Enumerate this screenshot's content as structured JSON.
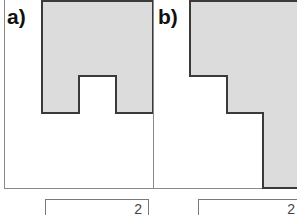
{
  "exercise": {
    "panels": [
      {
        "label": "a)",
        "grid": {
          "cols": 4,
          "rows": 5,
          "origin_x": 4,
          "cell_w": 37.25,
          "cell_h": 37.6
        },
        "shaded_cells": [
          [
            0,
            1
          ],
          [
            0,
            2
          ],
          [
            0,
            3
          ],
          [
            1,
            1
          ],
          [
            1,
            2
          ],
          [
            1,
            3
          ],
          [
            2,
            1
          ],
          [
            2,
            3
          ]
        ],
        "answer_unit": "2"
      },
      {
        "label": "b)",
        "grid": {
          "cols": 4,
          "rows": 5,
          "origin_x": 153,
          "cell_w": 36.7,
          "cell_h": 37.6
        },
        "shaded_cells": [
          [
            0,
            1
          ],
          [
            0,
            2
          ],
          [
            0,
            3
          ],
          [
            1,
            1
          ],
          [
            1,
            2
          ],
          [
            1,
            3
          ],
          [
            2,
            2
          ],
          [
            2,
            3
          ],
          [
            3,
            3
          ],
          [
            4,
            3
          ]
        ],
        "answer_unit": "2"
      }
    ],
    "colors": {
      "shade": "#dcdcdc",
      "grid_line": "#8a8a8a",
      "outline": "#3a3a3a"
    }
  }
}
